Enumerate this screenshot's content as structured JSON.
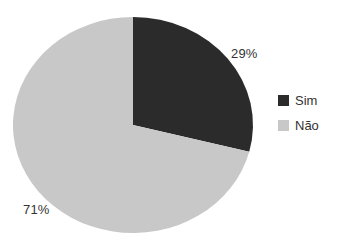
{
  "chart_data": {
    "type": "pie",
    "title": "",
    "categories": [
      "Sim",
      "Não"
    ],
    "values": [
      29,
      71
    ],
    "labels": [
      "29%",
      "71%"
    ],
    "colors": [
      "#2b2b2b",
      "#c8c8c8"
    ],
    "start_angle_deg": 0,
    "direction": "clockwise",
    "legend_position": "right",
    "text_color": "#333333",
    "background_color": "#ffffff"
  }
}
